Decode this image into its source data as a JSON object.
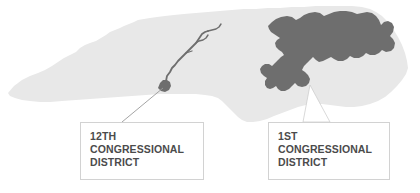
{
  "figure": {
    "background_color": "#ffffff",
    "state_fill": "#e8e8e8",
    "district_fill": "#6e6e6e",
    "callout_border_color": "#d2d2d2",
    "callout_text_color": "#4b4b4b"
  },
  "callouts": [
    {
      "id": "district-12",
      "lines": [
        "12TH",
        "CONGRESSIONAL",
        "DISTRICT"
      ],
      "line1": "12TH",
      "line2": "CONGRESSIONAL",
      "line3": "DISTRICT"
    },
    {
      "id": "district-1",
      "lines": [
        "1ST",
        "CONGRESSIONAL",
        "DISTRICT"
      ],
      "line1": "1ST",
      "line2": "CONGRESSIONAL",
      "line3": "DISTRICT"
    }
  ]
}
